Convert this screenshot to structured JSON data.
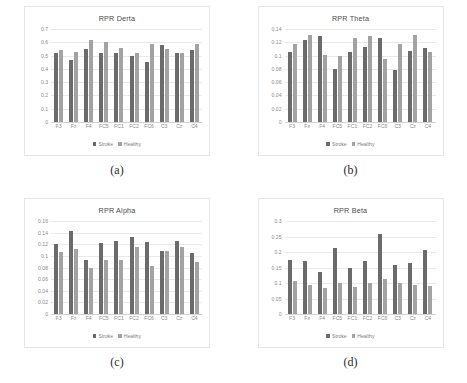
{
  "figure": {
    "series_names": [
      "Stroke",
      "Healthy"
    ],
    "colors": {
      "stroke": "#6b6b6b",
      "healthy": "#a3a3a3",
      "gridline": "#e9e9e9",
      "text": "#8a8a8a"
    },
    "categories": [
      "F3",
      "Fz",
      "F4",
      "FC5",
      "FC1",
      "FC2",
      "FC6",
      "C3",
      "Cz",
      "C4"
    ]
  },
  "panels": [
    {
      "caption": "(a)",
      "key": "delta"
    },
    {
      "caption": "(b)",
      "key": "theta"
    },
    {
      "caption": "(c)",
      "key": "alpha"
    },
    {
      "caption": "(d)",
      "key": "beta"
    }
  ],
  "chart_data": [
    {
      "type": "bar",
      "title": "RPR Derta",
      "xlabel": "",
      "ylabel": "",
      "ylim": [
        0,
        0.7
      ],
      "yticks": [
        0,
        0.1,
        0.2,
        0.3,
        0.4,
        0.5,
        0.6,
        0.7
      ],
      "ytick_labels": [
        "0",
        "0.1",
        "0.2",
        "0.3",
        "0.4",
        "0.5",
        "0.6",
        "0.7"
      ],
      "grid": true,
      "legend": "bottom",
      "categories": [
        "F3",
        "Fz",
        "F4",
        "FC5",
        "FC1",
        "FC2",
        "FC6",
        "C3",
        "Cz",
        "C4"
      ],
      "series": [
        {
          "name": "Stroke",
          "values": [
            0.52,
            0.47,
            0.55,
            0.52,
            0.52,
            0.5,
            0.45,
            0.58,
            0.52,
            0.54
          ]
        },
        {
          "name": "Healthy",
          "values": [
            0.54,
            0.53,
            0.62,
            0.6,
            0.56,
            0.52,
            0.59,
            0.55,
            0.52,
            0.59
          ]
        }
      ]
    },
    {
      "type": "bar",
      "title": "RPR Theta",
      "xlabel": "",
      "ylabel": "",
      "ylim": [
        0,
        0.14
      ],
      "yticks": [
        0,
        0.02,
        0.04,
        0.06,
        0.08,
        0.1,
        0.12,
        0.14
      ],
      "ytick_labels": [
        "0",
        "0.02",
        "0.04",
        "0.06",
        "0.08",
        "0.1",
        "0.12",
        "0.14"
      ],
      "grid": true,
      "legend": "bottom",
      "categories": [
        "F3",
        "Fz",
        "F4",
        "FC5",
        "FC1",
        "FC2",
        "FC6",
        "C3",
        "Cz",
        "C4"
      ],
      "series": [
        {
          "name": "Stroke",
          "values": [
            0.106,
            0.123,
            0.129,
            0.08,
            0.106,
            0.113,
            0.126,
            0.079,
            0.107,
            0.111
          ]
        },
        {
          "name": "Healthy",
          "values": [
            0.118,
            0.131,
            0.101,
            0.099,
            0.126,
            0.129,
            0.095,
            0.117,
            0.131,
            0.106
          ]
        }
      ]
    },
    {
      "type": "bar",
      "title": "RPR Alpha",
      "xlabel": "",
      "ylabel": "",
      "ylim": [
        0,
        0.16
      ],
      "yticks": [
        0,
        0.02,
        0.04,
        0.06,
        0.08,
        0.1,
        0.12,
        0.14,
        0.16
      ],
      "ytick_labels": [
        "0",
        "0.02",
        "0.04",
        "0.06",
        "0.08",
        "0.1",
        "0.12",
        "0.14",
        "0.16"
      ],
      "grid": true,
      "legend": "bottom",
      "categories": [
        "F3",
        "Fz",
        "F4",
        "FC5",
        "FC1",
        "FC2",
        "FC6",
        "C3",
        "Cz",
        "C4"
      ],
      "series": [
        {
          "name": "Stroke",
          "values": [
            0.12,
            0.142,
            0.093,
            0.122,
            0.125,
            0.132,
            0.124,
            0.108,
            0.125,
            0.105
          ]
        },
        {
          "name": "Healthy",
          "values": [
            0.107,
            0.112,
            0.08,
            0.093,
            0.093,
            0.116,
            0.082,
            0.109,
            0.115,
            0.089
          ]
        }
      ]
    },
    {
      "type": "bar",
      "title": "RPR Beta",
      "xlabel": "",
      "ylabel": "",
      "ylim": [
        0,
        0.3
      ],
      "yticks": [
        0,
        0.05,
        0.1,
        0.15,
        0.2,
        0.25,
        0.3
      ],
      "ytick_labels": [
        "0",
        "0.05",
        "0.1",
        "0.15",
        "0.2",
        "0.25",
        "0.3"
      ],
      "grid": true,
      "legend": "bottom",
      "categories": [
        "F3",
        "Fz",
        "F4",
        "FC5",
        "FC1",
        "FC2",
        "FC6",
        "C3",
        "Cz",
        "C4"
      ],
      "series": [
        {
          "name": "Stroke",
          "values": [
            0.174,
            0.172,
            0.134,
            0.212,
            0.147,
            0.172,
            0.257,
            0.157,
            0.163,
            0.208
          ]
        },
        {
          "name": "Healthy",
          "values": [
            0.106,
            0.094,
            0.085,
            0.099,
            0.087,
            0.101,
            0.112,
            0.099,
            0.095,
            0.091
          ]
        }
      ]
    }
  ]
}
